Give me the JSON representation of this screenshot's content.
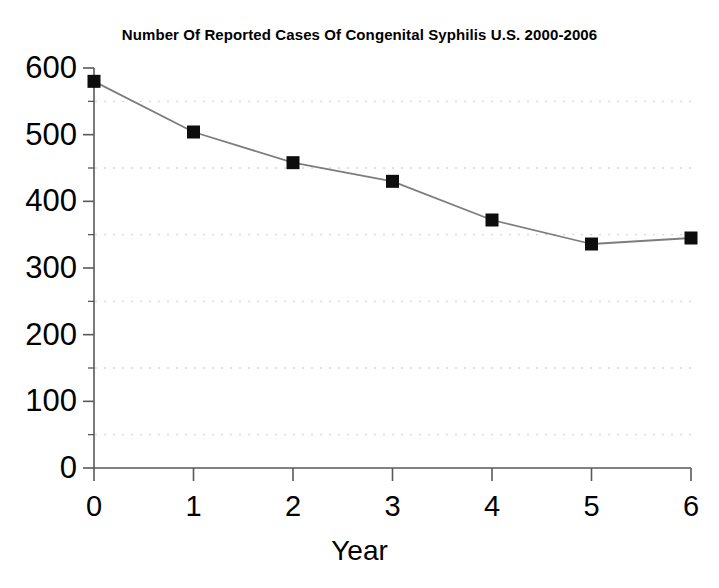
{
  "chart_data": {
    "type": "line",
    "title": "Number Of Reported Cases Of Congenital Syphilis U.S. 2000-2006",
    "xlabel": "Year",
    "ylabel": "",
    "x": [
      0,
      1,
      2,
      3,
      4,
      5,
      6
    ],
    "values": [
      580,
      504,
      458,
      430,
      372,
      336,
      345
    ],
    "categories": [
      "0",
      "1",
      "2",
      "3",
      "4",
      "5",
      "6"
    ],
    "xtick_labels": [
      "0",
      "1",
      "2",
      "3",
      "4",
      "5",
      "6"
    ],
    "ytick_labels": [
      "0",
      "100",
      "200",
      "300",
      "400",
      "500",
      "600"
    ],
    "ytick_values": [
      0,
      100,
      200,
      300,
      400,
      500,
      600
    ],
    "yminor_values": [
      50,
      150,
      250,
      350,
      450,
      550
    ],
    "xlim": [
      0,
      6
    ],
    "ylim": [
      0,
      600
    ],
    "grid": "horizontal-dotted-minor",
    "legend": "none",
    "series": [
      {
        "name": "Reported cases of congenital syphilis",
        "values": [
          580,
          504,
          458,
          430,
          372,
          336,
          345
        ],
        "marker": "filled-square",
        "marker_color": "#000000",
        "line_color": "#808080"
      }
    ],
    "colors": {
      "background": "#ffffff",
      "axis": "#595959",
      "grid": "#cfd6e4",
      "line": "#7d7d7d",
      "marker": "#0d0d0d",
      "text": "#000000"
    }
  }
}
